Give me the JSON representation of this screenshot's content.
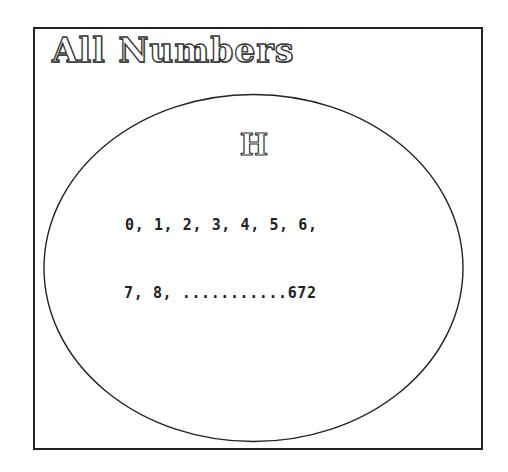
{
  "universal_set": {
    "label": "All Numbers"
  },
  "set": {
    "label": "H",
    "members_line1": "0, 1, 2, 3, 4, 5, 6,",
    "members_line2": "7, 8, ...........672"
  },
  "colors": {
    "stroke": "#222222",
    "background": "#ffffff"
  }
}
